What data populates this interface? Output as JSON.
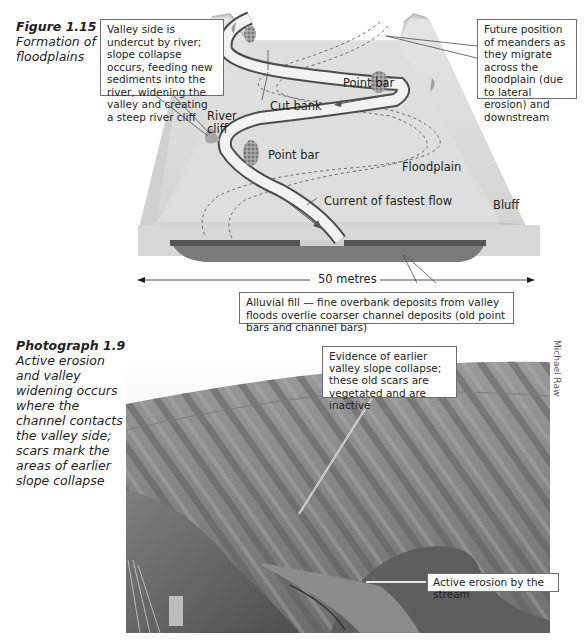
{
  "figure": {
    "label": "Figure 1.15",
    "caption": "Formation of floodplains",
    "callouts": {
      "valley_side": "Valley side is undercut by river; slope collapse occurs, feeding new sediments into the river, widening the valley and creating a steep river cliff",
      "future_meanders": "Future position of meanders as they migrate across the floodplain (due to lateral erosion) and downstream",
      "alluvial_fill": "Alluvial fill — fine overbank deposits from valley floods overlie coarser channel deposits (old point bars and channel bars)"
    },
    "labels": {
      "river_cliff_line1": "River",
      "river_cliff_line2": "cliff",
      "cut_bank": "Cut bank",
      "point_bar_upper": "Point bar",
      "point_bar_lower": "Point bar",
      "floodplain": "Floodplain",
      "current": "Current of fastest flow",
      "bluff": "Bluff",
      "scale": "50 metres"
    },
    "colors": {
      "plain": "#d9d9d9",
      "plain_light": "#e6e6e6",
      "river": "#f2f2f2",
      "river_edge": "#4d4d4d",
      "fill_dark": "#5a5a5a",
      "fill_mid": "#808080"
    }
  },
  "photograph": {
    "label": "Photograph 1.9",
    "caption": "Active erosion and valley widening occurs where the channel contacts the valley side; scars mark the areas of earlier slope collapse",
    "credit": "Michael Raw",
    "callouts": {
      "earlier_collapse": "Evidence of earlier valley slope collapse; these old scars are vegetated and are inactive",
      "active_erosion": "Active erosion by the stream"
    }
  }
}
